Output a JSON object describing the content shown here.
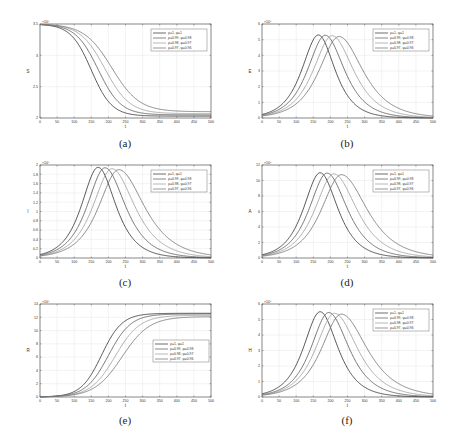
{
  "legend": [
    "ρ=1, ψ=1",
    "ρ=0.99, ψ=0.98",
    "ρ=0.98, ψ=0.97",
    "ρ=0.97, ψ=0.96"
  ],
  "series_colors": [
    "#2b2b2b",
    "#555555",
    "#9a9a9a",
    "#6e6e6e"
  ],
  "chart_data": [
    {
      "id": "a",
      "caption": "(a)",
      "type": "line",
      "title": "",
      "xlabel": "t",
      "ylabel": "S",
      "exponent": "×10⁶",
      "xlim": [
        0,
        500
      ],
      "ylim": [
        2,
        3.5
      ],
      "xticks": [
        0,
        50,
        100,
        150,
        200,
        250,
        300,
        350,
        400,
        450,
        500
      ],
      "yticks": [
        2,
        2.5,
        3,
        3.5
      ],
      "grid": true,
      "legend_position": "upper right",
      "shape": "sigmoid_down",
      "series": [
        {
          "name": "ρ=1, ψ=1",
          "start": 3.5,
          "end": 2.03,
          "midpoint": 150,
          "width": 30
        },
        {
          "name": "ρ=0.99, ψ=0.98",
          "start": 3.5,
          "end": 2.05,
          "midpoint": 170,
          "width": 33
        },
        {
          "name": "ρ=0.98, ψ=0.97",
          "start": 3.5,
          "end": 2.07,
          "midpoint": 190,
          "width": 36
        },
        {
          "name": "ρ=0.97, ψ=0.96",
          "start": 3.5,
          "end": 2.1,
          "midpoint": 210,
          "width": 40
        }
      ]
    },
    {
      "id": "b",
      "caption": "(b)",
      "type": "line",
      "title": "",
      "xlabel": "t",
      "ylabel": "E",
      "exponent": "×10⁵",
      "xlim": [
        0,
        500
      ],
      "ylim": [
        0,
        6
      ],
      "xticks": [
        0,
        50,
        100,
        150,
        200,
        250,
        300,
        350,
        400,
        450,
        500
      ],
      "yticks": [
        0,
        1,
        2,
        3,
        4,
        5,
        6
      ],
      "grid": true,
      "legend_position": "upper right",
      "shape": "peak",
      "series": [
        {
          "name": "ρ=1, ψ=1",
          "peak_t": 165,
          "peak": 5.3,
          "rise": 45,
          "fall": 45
        },
        {
          "name": "ρ=0.99, ψ=0.98",
          "peak_t": 185,
          "peak": 5.28,
          "rise": 48,
          "fall": 52
        },
        {
          "name": "ρ=0.98, ψ=0.97",
          "peak_t": 205,
          "peak": 5.25,
          "rise": 51,
          "fall": 58
        },
        {
          "name": "ρ=0.97, ψ=0.96",
          "peak_t": 225,
          "peak": 5.2,
          "rise": 54,
          "fall": 65
        }
      ]
    },
    {
      "id": "c",
      "caption": "(c)",
      "type": "line",
      "title": "",
      "xlabel": "t",
      "ylabel": "I",
      "exponent": "×10⁵",
      "xlim": [
        0,
        500
      ],
      "ylim": [
        0,
        2
      ],
      "xticks": [
        0,
        50,
        100,
        150,
        200,
        250,
        300,
        350,
        400,
        450,
        500
      ],
      "yticks": [
        0,
        0.2,
        0.4,
        0.6,
        0.8,
        1,
        1.2,
        1.4,
        1.6,
        1.8,
        2
      ],
      "grid": true,
      "legend_position": "upper right",
      "shape": "peak",
      "series": [
        {
          "name": "ρ=1, ψ=1",
          "peak_t": 170,
          "peak": 1.95,
          "rise": 45,
          "fall": 48
        },
        {
          "name": "ρ=0.99, ψ=0.98",
          "peak_t": 190,
          "peak": 1.94,
          "rise": 48,
          "fall": 55
        },
        {
          "name": "ρ=0.98, ψ=0.97",
          "peak_t": 210,
          "peak": 1.92,
          "rise": 51,
          "fall": 62
        },
        {
          "name": "ρ=0.97, ψ=0.96",
          "peak_t": 230,
          "peak": 1.9,
          "rise": 54,
          "fall": 70
        }
      ]
    },
    {
      "id": "d",
      "caption": "(d)",
      "type": "line",
      "title": "",
      "xlabel": "t",
      "ylabel": "A",
      "exponent": "×10⁵",
      "xlim": [
        0,
        500
      ],
      "ylim": [
        0,
        12
      ],
      "xticks": [
        0,
        50,
        100,
        150,
        200,
        250,
        300,
        350,
        400,
        450,
        500
      ],
      "yticks": [
        0,
        2,
        4,
        6,
        8,
        10,
        12
      ],
      "grid": true,
      "legend_position": "upper right",
      "shape": "peak",
      "series": [
        {
          "name": "ρ=1, ψ=1",
          "peak_t": 170,
          "peak": 11.0,
          "rise": 45,
          "fall": 48
        },
        {
          "name": "ρ=0.99, ψ=0.98",
          "peak_t": 190,
          "peak": 10.95,
          "rise": 48,
          "fall": 55
        },
        {
          "name": "ρ=0.98, ψ=0.97",
          "peak_t": 210,
          "peak": 10.85,
          "rise": 51,
          "fall": 62
        },
        {
          "name": "ρ=0.97, ψ=0.96",
          "peak_t": 232,
          "peak": 10.75,
          "rise": 54,
          "fall": 70
        }
      ]
    },
    {
      "id": "e",
      "caption": "(e)",
      "type": "line",
      "title": "",
      "xlabel": "t",
      "ylabel": "R",
      "exponent": "×10⁵",
      "xlim": [
        0,
        500
      ],
      "ylim": [
        0,
        14
      ],
      "xticks": [
        0,
        50,
        100,
        150,
        200,
        250,
        300,
        350,
        400,
        450,
        500
      ],
      "yticks": [
        0,
        2,
        4,
        6,
        8,
        10,
        12,
        14
      ],
      "grid": true,
      "legend_position": "center right",
      "shape": "sigmoid_up",
      "series": [
        {
          "name": "ρ=1, ψ=1",
          "start": 0,
          "end": 12.6,
          "midpoint": 180,
          "width": 30
        },
        {
          "name": "ρ=0.99, ψ=0.98",
          "start": 0,
          "end": 12.5,
          "midpoint": 200,
          "width": 33
        },
        {
          "name": "ρ=0.98, ψ=0.97",
          "start": 0,
          "end": 12.3,
          "midpoint": 220,
          "width": 36
        },
        {
          "name": "ρ=0.97, ψ=0.96",
          "start": 0,
          "end": 12.1,
          "midpoint": 240,
          "width": 40
        }
      ]
    },
    {
      "id": "f",
      "caption": "(f)",
      "type": "line",
      "title": "",
      "xlabel": "t",
      "ylabel": "H",
      "exponent": "×10⁵",
      "xlim": [
        0,
        500
      ],
      "ylim": [
        0,
        6
      ],
      "xticks": [
        0,
        50,
        100,
        150,
        200,
        250,
        300,
        350,
        400,
        450,
        500
      ],
      "yticks": [
        0,
        1,
        2,
        3,
        4,
        5,
        6
      ],
      "grid": true,
      "legend_position": "upper right",
      "shape": "peak",
      "series": [
        {
          "name": "ρ=1, ψ=1",
          "peak_t": 170,
          "peak": 5.5,
          "rise": 45,
          "fall": 48
        },
        {
          "name": "ρ=0.99, ψ=0.98",
          "peak_t": 195,
          "peak": 5.45,
          "rise": 48,
          "fall": 55
        },
        {
          "name": "ρ=0.98, ψ=0.97",
          "peak_t": 212,
          "peak": 5.4,
          "rise": 51,
          "fall": 62
        },
        {
          "name": "ρ=0.97, ψ=0.96",
          "peak_t": 232,
          "peak": 5.35,
          "rise": 54,
          "fall": 70
        }
      ]
    }
  ]
}
